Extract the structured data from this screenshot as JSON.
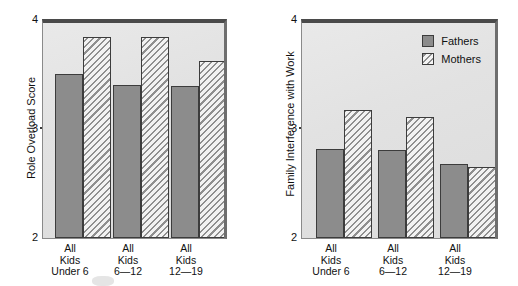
{
  "figure": {
    "legend": {
      "position": "top-right-of-right-panel",
      "entries": [
        {
          "label": "Fathers",
          "pattern": "solid-gray",
          "color": "#8c8c8c"
        },
        {
          "label": "Mothers",
          "pattern": "diagonal-hatch",
          "color": "#ffffff"
        }
      ]
    },
    "categories": [
      "All\nKids\nUnder 6",
      "All\nKids\n6—12",
      "All\nKids\n12—19"
    ]
  },
  "chart_data": [
    {
      "type": "bar",
      "title": "",
      "panel": "left",
      "xlabel": "",
      "ylabel": "Role Overload Score",
      "ylim": [
        2,
        4
      ],
      "yticks": [
        2,
        3,
        4
      ],
      "ytick_labels": [
        "2",
        "3",
        "4"
      ],
      "grid": false,
      "legend": "none",
      "categories": [
        "All Kids Under 6",
        "All Kids 6—12",
        "All Kids 12—19"
      ],
      "series": [
        {
          "name": "Fathers",
          "values": [
            3.49,
            3.39,
            3.38
          ]
        },
        {
          "name": "Mothers",
          "values": [
            3.83,
            3.83,
            3.61
          ]
        }
      ]
    },
    {
      "type": "bar",
      "title": "",
      "panel": "right",
      "xlabel": "",
      "ylabel": "Family Interference with Work",
      "ylim": [
        2,
        4
      ],
      "yticks": [
        2,
        3,
        4
      ],
      "ytick_labels": [
        "2",
        "3",
        "4"
      ],
      "grid": false,
      "legend": "top-right",
      "categories": [
        "All Kids Under 6",
        "All Kids 6—12",
        "All Kids 12—19"
      ],
      "series": [
        {
          "name": "Fathers",
          "values": [
            2.81,
            2.8,
            2.67
          ]
        },
        {
          "name": "Mothers",
          "values": [
            3.16,
            3.1,
            2.65
          ]
        }
      ]
    }
  ]
}
